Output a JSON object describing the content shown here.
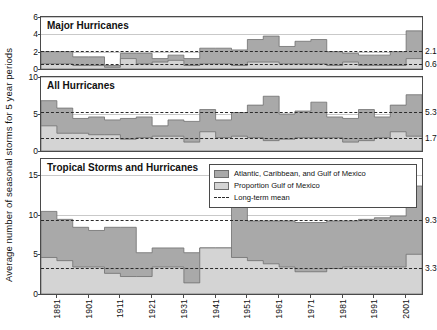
{
  "axis": {
    "ylabel": "Average number of seasonal storms for 5 year periods",
    "xticks": [
      "1891",
      "1901",
      "1911",
      "1921",
      "1931",
      "1941",
      "1951",
      "1961",
      "1971",
      "1981",
      "1991",
      "2001"
    ]
  },
  "legend": {
    "items": [
      {
        "label": "Atlantic, Caribbean, and Gulf of Mexico",
        "kind": "swatch",
        "color": "#a9a9a9"
      },
      {
        "label": "Proportion Gulf of Mexico",
        "kind": "swatch",
        "color": "#d4d4d4"
      },
      {
        "label": "Long-term mean",
        "kind": "dash",
        "color": "#2b2b2b"
      }
    ]
  },
  "colors": {
    "total_fill": "#a9a9a9",
    "gulf_fill": "#d4d4d4",
    "outline": "#6e6e6e",
    "mean_line": "#2b2b2b",
    "grid": "#c9c9c9",
    "frame": "#4a4a4a",
    "background": "#ffffff"
  },
  "chart_data": [
    {
      "type": "area",
      "title": "Major Hurricanes",
      "panel": 1,
      "xlabel": "",
      "ylabel": "Average number of seasonal storms for 5 year periods",
      "ylim": [
        0,
        6
      ],
      "yticks": [
        0,
        2,
        4,
        6
      ],
      "grid": true,
      "x": [
        1886,
        1891,
        1896,
        1901,
        1906,
        1911,
        1916,
        1921,
        1926,
        1931,
        1936,
        1941,
        1946,
        1951,
        1956,
        1961,
        1966,
        1971,
        1976,
        1981,
        1986,
        1991,
        1996,
        2001
      ],
      "xtick_labels": [
        "1891",
        "1901",
        "1911",
        "1921",
        "1931",
        "1941",
        "1951",
        "1961",
        "1971",
        "1981",
        "1991",
        "2001"
      ],
      "series": [
        {
          "name": "Atlantic, Caribbean, and Gulf of Mexico",
          "values": [
            2.0,
            2.0,
            1.4,
            1.4,
            0.4,
            1.8,
            1.8,
            1.2,
            1.6,
            1.2,
            2.4,
            2.4,
            2.2,
            3.4,
            3.8,
            2.6,
            3.2,
            3.4,
            2.0,
            1.8,
            1.6,
            1.6,
            2.0,
            4.4
          ]
        },
        {
          "name": "Proportion Gulf of Mexico",
          "values": [
            0.6,
            0.6,
            0.4,
            0.4,
            0.2,
            1.2,
            0.6,
            0.8,
            1.0,
            0.4,
            0.6,
            0.6,
            0.4,
            0.8,
            0.8,
            0.6,
            0.6,
            0.6,
            0.4,
            0.8,
            0.4,
            0.4,
            0.4,
            1.2
          ]
        }
      ],
      "mean_lines": [
        {
          "value": 2.1,
          "label": "2.1",
          "series": "Atlantic, Caribbean, and Gulf of Mexico"
        },
        {
          "value": 0.6,
          "label": "0.6",
          "series": "Proportion Gulf of Mexico"
        }
      ]
    },
    {
      "type": "area",
      "title": "All Hurricanes",
      "panel": 2,
      "xlabel": "",
      "ylabel": "",
      "ylim": [
        0,
        10
      ],
      "yticks": [
        0,
        5,
        10
      ],
      "grid": true,
      "x": [
        1886,
        1891,
        1896,
        1901,
        1906,
        1911,
        1916,
        1921,
        1926,
        1931,
        1936,
        1941,
        1946,
        1951,
        1956,
        1961,
        1966,
        1971,
        1976,
        1981,
        1986,
        1991,
        1996,
        2001
      ],
      "xtick_labels": [
        "1891",
        "1901",
        "1911",
        "1921",
        "1931",
        "1941",
        "1951",
        "1961",
        "1971",
        "1981",
        "1991",
        "2001"
      ],
      "series": [
        {
          "name": "Atlantic, Caribbean, and Gulf of Mexico",
          "values": [
            6.8,
            5.8,
            4.4,
            4.6,
            4.2,
            4.4,
            4.6,
            3.4,
            4.2,
            4.0,
            5.6,
            4.2,
            5.2,
            6.2,
            7.4,
            5.0,
            5.4,
            6.6,
            4.6,
            4.4,
            5.6,
            4.6,
            6.2,
            7.6
          ]
        },
        {
          "name": "Proportion Gulf of Mexico",
          "values": [
            3.4,
            2.4,
            2.4,
            2.2,
            2.2,
            1.6,
            1.8,
            2.0,
            2.0,
            1.2,
            2.6,
            1.8,
            2.0,
            1.8,
            1.4,
            1.6,
            1.8,
            1.8,
            1.8,
            1.2,
            1.4,
            1.8,
            2.6,
            2.0
          ]
        }
      ],
      "mean_lines": [
        {
          "value": 5.3,
          "label": "5.3",
          "series": "Atlantic, Caribbean, and Gulf of Mexico"
        },
        {
          "value": 1.7,
          "label": "1.7",
          "series": "Proportion Gulf of Mexico"
        }
      ]
    },
    {
      "type": "area",
      "title": "Tropical Storms and Hurricanes",
      "panel": 3,
      "xlabel": "",
      "ylabel": "",
      "ylim": [
        0,
        17
      ],
      "yticks": [
        0,
        5,
        10,
        15
      ],
      "grid": true,
      "x": [
        1886,
        1891,
        1896,
        1901,
        1906,
        1911,
        1916,
        1921,
        1926,
        1931,
        1936,
        1941,
        1946,
        1951,
        1956,
        1961,
        1966,
        1971,
        1976,
        1981,
        1986,
        1991,
        1996,
        2001
      ],
      "xtick_labels": [
        "1891",
        "1901",
        "1911",
        "1921",
        "1931",
        "1941",
        "1951",
        "1961",
        "1971",
        "1981",
        "1991",
        "2001"
      ],
      "series": [
        {
          "name": "Atlantic, Caribbean, and Gulf of Mexico",
          "values": [
            10.4,
            9.4,
            8.4,
            8.0,
            8.4,
            8.4,
            5.2,
            5.8,
            5.8,
            5.2,
            5.8,
            5.8,
            11.2,
            9.2,
            9.2,
            9.2,
            9.0,
            9.0,
            9.2,
            9.2,
            9.4,
            9.6,
            9.8,
            13.6
          ]
        },
        {
          "name": "Proportion Gulf of Mexico",
          "values": [
            4.6,
            4.2,
            3.4,
            3.4,
            2.6,
            2.2,
            2.2,
            3.4,
            3.4,
            1.4,
            5.8,
            5.8,
            4.6,
            4.2,
            3.8,
            3.4,
            2.8,
            2.8,
            3.2,
            3.4,
            3.4,
            3.4,
            3.4,
            5.0
          ]
        }
      ],
      "mean_lines": [
        {
          "value": 9.3,
          "label": "9.3",
          "series": "Atlantic, Caribbean, and Gulf of Mexico"
        },
        {
          "value": 3.3,
          "label": "3.3",
          "series": "Proportion Gulf of Mexico"
        }
      ]
    }
  ]
}
